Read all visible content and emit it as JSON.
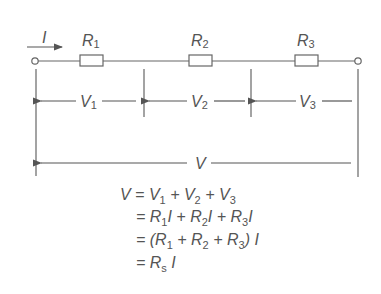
{
  "diagram": {
    "type": "series-resistor-circuit",
    "current": {
      "label": "I"
    },
    "resistors": [
      {
        "name": "R",
        "sub": "1"
      },
      {
        "name": "R",
        "sub": "2"
      },
      {
        "name": "R",
        "sub": "3"
      }
    ],
    "voltages": [
      {
        "name": "V",
        "sub": "1"
      },
      {
        "name": "V",
        "sub": "2"
      },
      {
        "name": "V",
        "sub": "3"
      }
    ],
    "total_voltage": {
      "label": "V"
    },
    "colors": {
      "stroke": "#666666",
      "text": "#555555",
      "background": "#ffffff"
    }
  },
  "equations": [
    {
      "text": "V = V1 + V2 + V3"
    },
    {
      "text": "= R1 I + R2 I + R3 I"
    },
    {
      "text": "= (R1 + R2 + R3) I"
    },
    {
      "text": "= Rs I"
    }
  ]
}
